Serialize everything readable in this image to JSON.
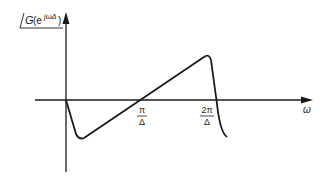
{
  "diagram": {
    "y_axis_label": {
      "prefix": "G",
      "open": "(e",
      "exponent": "jωΔ",
      "close": ")",
      "full": "∠G(e^{jωΔ})"
    },
    "x_axis_label": "ω",
    "ticks": [
      {
        "numerator": "π",
        "denominator": "Δ"
      },
      {
        "numerator": "2π",
        "denominator": "Δ"
      }
    ],
    "curve_description": "Phase of G(e^{jωΔ}): drops sharply just after 0, rises linearly through π/Δ, peaks before 2π/Δ, then drops sharply",
    "line_color": "#1a1a1a"
  }
}
